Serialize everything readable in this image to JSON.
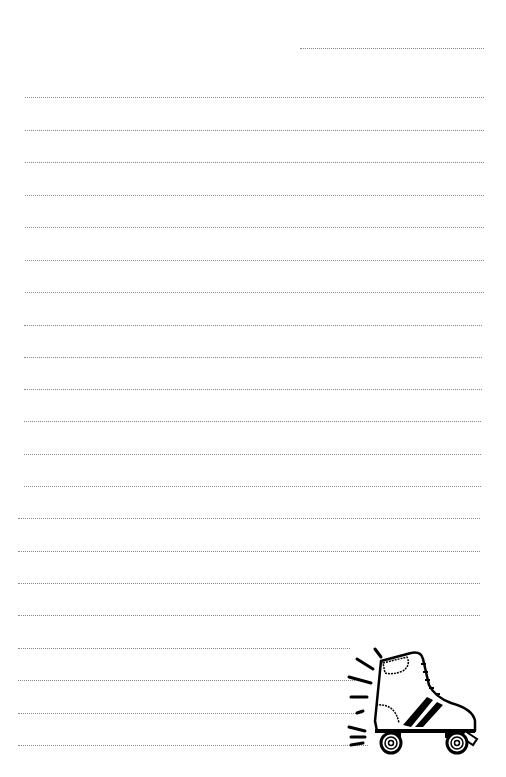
{
  "page": {
    "background": "#ffffff",
    "line_color": "#8a8a8a",
    "header_line": {
      "x1": 300,
      "x2": 484,
      "y": 48
    },
    "lines": [
      {
        "x1": 25,
        "x2": 484,
        "y": 97
      },
      {
        "x1": 25,
        "x2": 484,
        "y": 130
      },
      {
        "x1": 25,
        "x2": 484,
        "y": 162
      },
      {
        "x1": 25,
        "x2": 484,
        "y": 195
      },
      {
        "x1": 25,
        "x2": 484,
        "y": 227
      },
      {
        "x1": 25,
        "x2": 484,
        "y": 260
      },
      {
        "x1": 25,
        "x2": 484,
        "y": 292
      },
      {
        "x1": 24,
        "x2": 482,
        "y": 325
      },
      {
        "x1": 24,
        "x2": 482,
        "y": 357
      },
      {
        "x1": 24,
        "x2": 482,
        "y": 389
      },
      {
        "x1": 24,
        "x2": 481,
        "y": 421
      },
      {
        "x1": 24,
        "x2": 481,
        "y": 454
      },
      {
        "x1": 24,
        "x2": 481,
        "y": 486
      },
      {
        "x1": 18,
        "x2": 480,
        "y": 518
      },
      {
        "x1": 18,
        "x2": 480,
        "y": 551
      },
      {
        "x1": 18,
        "x2": 480,
        "y": 583
      },
      {
        "x1": 18,
        "x2": 480,
        "y": 615
      },
      {
        "x1": 18,
        "x2": 350,
        "y": 648
      },
      {
        "x1": 18,
        "x2": 355,
        "y": 680
      },
      {
        "x1": 18,
        "x2": 362,
        "y": 713
      },
      {
        "x1": 18,
        "x2": 368,
        "y": 745
      }
    ],
    "illustration": {
      "name": "roller-skate",
      "x": 345,
      "y": 645
    }
  }
}
